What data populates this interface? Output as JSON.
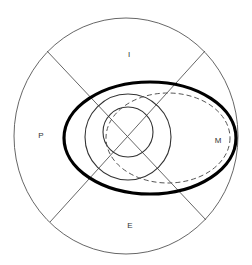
{
  "diagram": {
    "type": "concentric-quadrant-diagram",
    "quadrant_labels": {
      "top": "I",
      "left": "P",
      "right": "M",
      "bottom": "E"
    },
    "shapes": [
      {
        "name": "outer-circle",
        "style": "thin"
      },
      {
        "name": "divider-lines",
        "style": "thin",
        "count": 2,
        "description": "two diagonal lines crossing at center, dividing outer circle into four quadrants"
      },
      {
        "name": "thick-ellipse",
        "style": "thick-solid"
      },
      {
        "name": "middle-circle",
        "style": "solid"
      },
      {
        "name": "inner-circle",
        "style": "solid"
      },
      {
        "name": "dashed-ellipse",
        "style": "dashed",
        "description": "ellipse offset toward M quadrant"
      }
    ],
    "colors": {
      "background": "#ffffff",
      "stroke_thin": "#555555",
      "stroke_thick": "#000000",
      "label": "#333333"
    }
  }
}
